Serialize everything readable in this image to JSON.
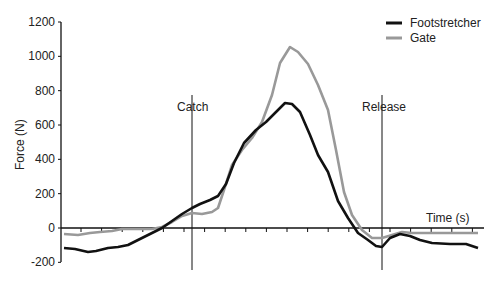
{
  "chart_data": {
    "type": "line",
    "title": "",
    "xlabel": "Time (s)",
    "ylabel": "Force (N)",
    "ylim": [
      -200,
      1200
    ],
    "yticks": [
      -200,
      0,
      200,
      400,
      600,
      800,
      1000,
      1200
    ],
    "grid": false,
    "legend_position": "top-right",
    "annotations": [
      {
        "label": "Catch",
        "x_px": 192
      },
      {
        "label": "Release",
        "x_px": 382
      }
    ],
    "series": [
      {
        "name": "Footstretcher",
        "color": "#111111",
        "points_px": [
          [
            64,
            248
          ],
          [
            75,
            249
          ],
          [
            88,
            252
          ],
          [
            96,
            251
          ],
          [
            108,
            248
          ],
          [
            118,
            247
          ],
          [
            128,
            245
          ],
          [
            140,
            239
          ],
          [
            152,
            233
          ],
          [
            162,
            228
          ],
          [
            172,
            221
          ],
          [
            182,
            214
          ],
          [
            192,
            208
          ],
          [
            200,
            204
          ],
          [
            210,
            200
          ],
          [
            218,
            196
          ],
          [
            226,
            184
          ],
          [
            234,
            163
          ],
          [
            244,
            143
          ],
          [
            256,
            130
          ],
          [
            266,
            122
          ],
          [
            275,
            113
          ],
          [
            285,
            103
          ],
          [
            292,
            104
          ],
          [
            300,
            112
          ],
          [
            310,
            135
          ],
          [
            318,
            155
          ],
          [
            328,
            172
          ],
          [
            338,
            201
          ],
          [
            348,
            218
          ],
          [
            358,
            233
          ],
          [
            368,
            240
          ],
          [
            376,
            246
          ],
          [
            382,
            247
          ],
          [
            390,
            238
          ],
          [
            400,
            234
          ],
          [
            410,
            236
          ],
          [
            420,
            240
          ],
          [
            432,
            243
          ],
          [
            450,
            244
          ],
          [
            466,
            244
          ],
          [
            478,
            248
          ]
        ],
        "values_approx": [
          -125,
          -130,
          -145,
          -135,
          -120,
          -110,
          -95,
          -65,
          -30,
          0,
          40,
          80,
          115,
          140,
          165,
          190,
          260,
          380,
          500,
          575,
          630,
          680,
          740,
          930,
          920,
          880,
          750,
          625,
          530,
          350,
          200,
          110,
          40,
          -200,
          -190,
          -90,
          -110,
          -130,
          -150,
          -160,
          -155,
          -165
        ]
      },
      {
        "name": "Gate",
        "color": "#999999",
        "points_px": [
          [
            64,
            234
          ],
          [
            78,
            235
          ],
          [
            90,
            233
          ],
          [
            100,
            232
          ],
          [
            112,
            231
          ],
          [
            122,
            229
          ],
          [
            132,
            229
          ],
          [
            142,
            229
          ],
          [
            152,
            229
          ],
          [
            162,
            227
          ],
          [
            172,
            222
          ],
          [
            182,
            216
          ],
          [
            192,
            213
          ],
          [
            202,
            214
          ],
          [
            212,
            212
          ],
          [
            218,
            208
          ],
          [
            224,
            190
          ],
          [
            232,
            165
          ],
          [
            242,
            150
          ],
          [
            252,
            138
          ],
          [
            262,
            122
          ],
          [
            272,
            95
          ],
          [
            280,
            63
          ],
          [
            290,
            47
          ],
          [
            298,
            52
          ],
          [
            308,
            64
          ],
          [
            318,
            85
          ],
          [
            328,
            110
          ],
          [
            336,
            150
          ],
          [
            344,
            192
          ],
          [
            352,
            215
          ],
          [
            362,
            230
          ],
          [
            372,
            238
          ],
          [
            382,
            238
          ],
          [
            392,
            235
          ],
          [
            402,
            232
          ],
          [
            412,
            233
          ],
          [
            422,
            233
          ],
          [
            440,
            233
          ],
          [
            466,
            233
          ],
          [
            478,
            233
          ]
        ],
        "values_approx": [
          -35,
          -40,
          -30,
          -25,
          -20,
          -5,
          -5,
          0,
          0,
          5,
          35,
          70,
          90,
          85,
          95,
          120,
          220,
          365,
          450,
          525,
          620,
          775,
          960,
          1055,
          1030,
          960,
          840,
          690,
          460,
          210,
          80,
          -10,
          -60,
          -115,
          -100,
          -80,
          -30,
          -30,
          -30,
          -30,
          -30
        ]
      }
    ]
  },
  "legend": {
    "items": [
      {
        "label": "Footstretcher",
        "color": "#111111"
      },
      {
        "label": "Gate",
        "color": "#999999"
      }
    ]
  },
  "axes": {
    "ylabel": "Force (N)",
    "xlabel": "Time (s)",
    "ytick_labels": [
      "1200",
      "1000",
      "800",
      "600",
      "400",
      "200",
      "0",
      "-200"
    ]
  },
  "markers": {
    "catch": "Catch",
    "release": "Release"
  }
}
